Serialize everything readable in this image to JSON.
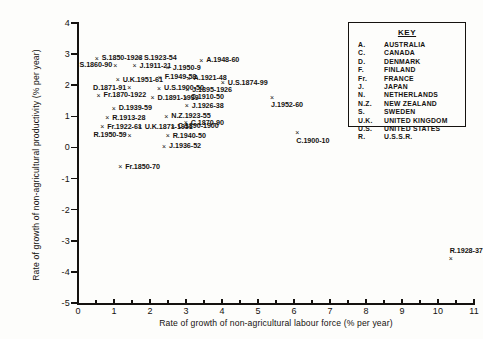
{
  "chart_data": {
    "type": "scatter",
    "title": "",
    "xlabel": "Rate of growth of non-agricultural labour force (% per year)",
    "ylabel": "Rate of growth of non-agricultural productivity (% per year)",
    "xlim": [
      0,
      11
    ],
    "ylim": [
      -5,
      4
    ],
    "xticks": [
      0,
      1,
      2,
      3,
      4,
      5,
      6,
      7,
      8,
      9,
      10,
      11
    ],
    "xtick_labels": [
      "0",
      "1",
      "2",
      "3",
      "4",
      "5",
      "6",
      "7",
      "8",
      "9",
      "10",
      "11"
    ],
    "yticks": [
      4,
      3,
      2,
      1,
      0,
      -1,
      -2,
      -3,
      -4,
      -5
    ],
    "ytick_labels": [
      "4",
      "3",
      "2",
      "1",
      "0",
      "-1",
      "-2",
      "-3",
      "-4",
      "-5"
    ],
    "grid": false,
    "legend_position": "top-right",
    "marker": "x",
    "points": [
      {
        "label": "S.1850-1923",
        "x": 0.55,
        "y": 2.86,
        "lpos": "right"
      },
      {
        "label": "S.1923-54",
        "x": 1.72,
        "y": 2.88,
        "lpos": "right"
      },
      {
        "label": "S.1860-90",
        "x": 1.06,
        "y": 2.65,
        "lpos": "left"
      },
      {
        "label": "J.1911-21",
        "x": 1.6,
        "y": 2.62,
        "lpos": "right"
      },
      {
        "label": "J.1950-9",
        "x": 2.52,
        "y": 2.56,
        "lpos": "right"
      },
      {
        "label": "A.1948-60",
        "x": 3.45,
        "y": 2.8,
        "lpos": "right"
      },
      {
        "label": "U.K.1951-61",
        "x": 1.13,
        "y": 2.17,
        "lpos": "right"
      },
      {
        "label": "F.1949-58",
        "x": 2.3,
        "y": 2.26,
        "lpos": "right"
      },
      {
        "label": "A.1921-48",
        "x": 3.1,
        "y": 2.22,
        "lpos": "right"
      },
      {
        "label": "U.S.1874-99",
        "x": 4.05,
        "y": 2.08,
        "lpos": "right"
      },
      {
        "label": "D.1871-91",
        "x": 1.45,
        "y": 1.92,
        "lpos": "left"
      },
      {
        "label": "U.S.1900-50",
        "x": 2.28,
        "y": 1.9,
        "lpos": "right"
      },
      {
        "label": "J.1895-1926",
        "x": 3.06,
        "y": 1.86,
        "lpos": "right"
      },
      {
        "label": "Fr.1870-1922",
        "x": 0.6,
        "y": 1.68,
        "lpos": "right"
      },
      {
        "label": "D.1891-1939",
        "x": 2.1,
        "y": 1.6,
        "lpos": "right"
      },
      {
        "label": "C.1910-50",
        "x": 3.02,
        "y": 1.62,
        "lpos": "right"
      },
      {
        "label": "J.1952-60",
        "x": 5.42,
        "y": 1.62,
        "lpos": "below"
      },
      {
        "label": "J.1926-38",
        "x": 3.05,
        "y": 1.34,
        "lpos": "right"
      },
      {
        "label": "D.1939-59",
        "x": 1.02,
        "y": 1.26,
        "lpos": "right"
      },
      {
        "label": "R.1913-28",
        "x": 0.84,
        "y": 0.96,
        "lpos": "right"
      },
      {
        "label": "N.Z.1923-55",
        "x": 2.48,
        "y": 1.0,
        "lpos": "right"
      },
      {
        "label": "C.1870-90",
        "x": 3.02,
        "y": 0.8,
        "lpos": "right"
      },
      {
        "label": "Fr.1922-61",
        "x": 0.7,
        "y": 0.66,
        "lpos": "right"
      },
      {
        "label": "U.K.1871-1951",
        "x": 1.74,
        "y": 0.66,
        "lpos": "right"
      },
      {
        "label": "C.1890-1900",
        "x": 2.66,
        "y": 0.68,
        "lpos": "right"
      },
      {
        "label": "R.1950-59",
        "x": 1.46,
        "y": 0.4,
        "lpos": "left"
      },
      {
        "label": "R.1940-50",
        "x": 2.52,
        "y": 0.38,
        "lpos": "right"
      },
      {
        "label": "C.1900-10",
        "x": 6.12,
        "y": 0.48,
        "lpos": "below"
      },
      {
        "label": "J.1936-52",
        "x": 2.42,
        "y": 0.04,
        "lpos": "right"
      },
      {
        "label": "Fr.1850-70",
        "x": 1.2,
        "y": -0.62,
        "lpos": "right"
      },
      {
        "label": "R.1928-37",
        "x": 10.38,
        "y": -3.56,
        "lpos": "above"
      }
    ]
  },
  "key": {
    "title": "KEY",
    "entries": [
      {
        "abbr": "A.",
        "name": "AUSTRALIA"
      },
      {
        "abbr": "C.",
        "name": "CANADA"
      },
      {
        "abbr": "D.",
        "name": "DENMARK"
      },
      {
        "abbr": "F.",
        "name": "FINLAND"
      },
      {
        "abbr": "Fr.",
        "name": "FRANCE"
      },
      {
        "abbr": "J.",
        "name": "JAPAN"
      },
      {
        "abbr": "N.",
        "name": "NETHERLANDS"
      },
      {
        "abbr": "N.Z.",
        "name": "NEW ZEALAND"
      },
      {
        "abbr": "S.",
        "name": "SWEDEN"
      },
      {
        "abbr": "U.K.",
        "name": "UNITED KINGDOM"
      },
      {
        "abbr": "U.S.",
        "name": "UNITED STATES"
      },
      {
        "abbr": "R.",
        "name": "U.S.S.R."
      }
    ]
  },
  "marker_glyph": "×"
}
